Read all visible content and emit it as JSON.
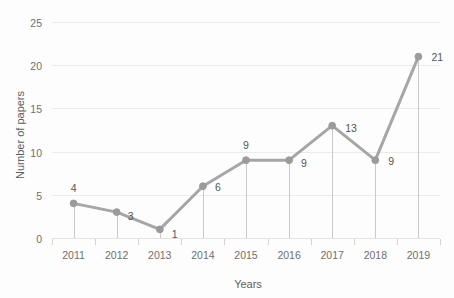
{
  "chart_data": {
    "type": "line",
    "title": "",
    "xlabel": "Years",
    "ylabel": "Number of papers",
    "categories": [
      "2011",
      "2012",
      "2013",
      "2014",
      "2015",
      "2016",
      "2017",
      "2018",
      "2019"
    ],
    "values": [
      4,
      3,
      1,
      6,
      9,
      9,
      13,
      9,
      21
    ],
    "data_labels": [
      "4",
      "3",
      "1",
      "6",
      "9",
      "9",
      "13",
      "9",
      "21"
    ],
    "ylim": [
      0,
      25
    ],
    "ytick_step": 5,
    "ytick_labels": [
      "0",
      "5",
      "10",
      "15",
      "20",
      "25"
    ],
    "xtick_labels": [
      "2011",
      "2012",
      "2013",
      "2014",
      "2015",
      "2016",
      "2017",
      "2018",
      "2019"
    ],
    "grid": "horizontal",
    "legend": "none",
    "series": [
      {
        "name": "Number of papers",
        "values": [
          4,
          3,
          1,
          6,
          9,
          9,
          13,
          9,
          21
        ]
      }
    ],
    "colors": {
      "line": "#a6a6a6",
      "marker": "#9b9b9b",
      "gridline": "#ececec",
      "dropline": "#c9c9c9",
      "text": "#5e5e5e",
      "background": "#fdfdfd"
    },
    "marker_style": "circle",
    "droplines": true
  }
}
